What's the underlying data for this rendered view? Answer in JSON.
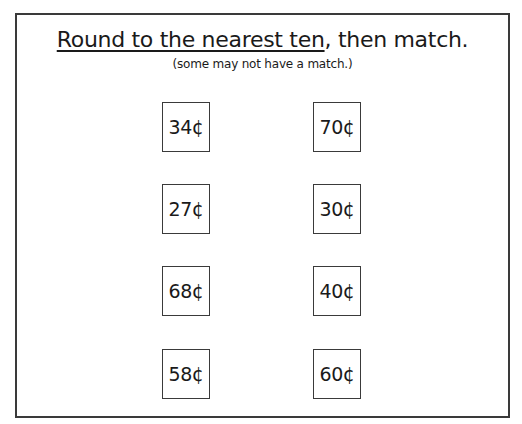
{
  "worksheet": {
    "title_underlined": "Round to the nearest ten",
    "title_rest": ", then match.",
    "subtitle": "(some may not have a match.)",
    "left_column": [
      {
        "value": "34¢"
      },
      {
        "value": "27¢"
      },
      {
        "value": "68¢"
      },
      {
        "value": "58¢"
      }
    ],
    "right_column": [
      {
        "value": "70¢"
      },
      {
        "value": "30¢"
      },
      {
        "value": "40¢"
      },
      {
        "value": "60¢"
      }
    ]
  }
}
